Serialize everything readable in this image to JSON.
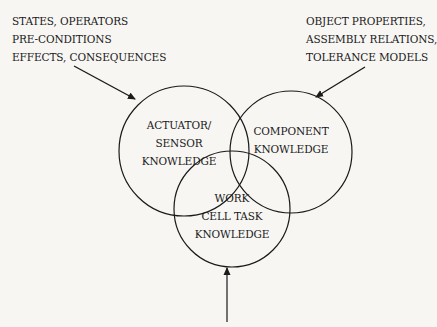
{
  "diagram": {
    "type": "venn",
    "circles": [
      {
        "id": "actuator-sensor",
        "lines": [
          "ACTUATOR/",
          "SENSOR",
          "KNOWLEDGE"
        ]
      },
      {
        "id": "component",
        "lines": [
          "COMPONENT",
          "KNOWLEDGE"
        ]
      },
      {
        "id": "work-cell-task",
        "lines": [
          "WORK",
          "CELL TASK",
          "KNOWLEDGE"
        ]
      }
    ],
    "inputs": {
      "actuator": [
        "STATES, OPERATORS",
        "PRE-CONDITIONS",
        "EFFECTS, CONSEQUENCES"
      ],
      "component": [
        "OBJECT PROPERTIES,",
        "ASSEMBLY RELATIONS,",
        "TOLERANCE MODELS"
      ]
    },
    "colors": {
      "line": "#1a1a1a",
      "background": "#f7f6f3"
    }
  }
}
